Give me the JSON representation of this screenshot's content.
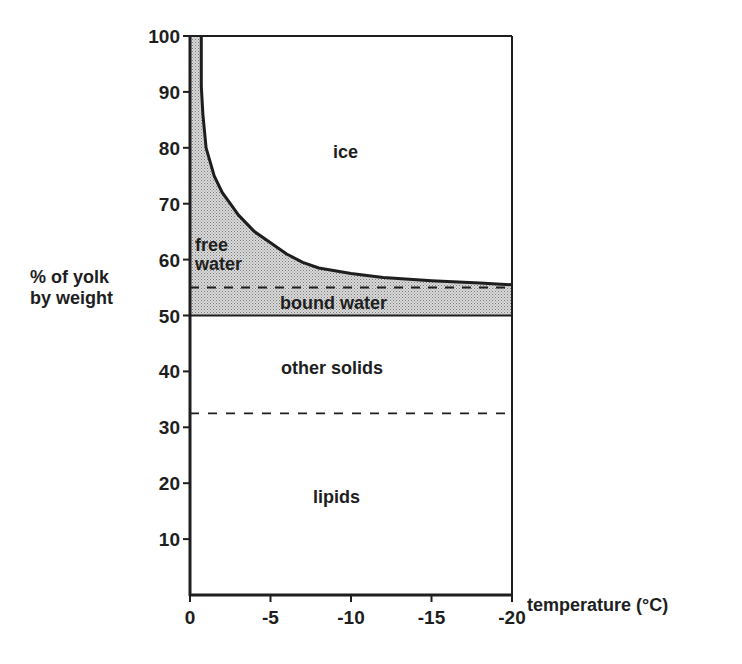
{
  "chart_data": {
    "type": "area",
    "title": "",
    "xlabel": "temperature (°C)",
    "ylabel": "% of yolk by weight",
    "ylabel_lines": [
      "% of yolk",
      "by weight"
    ],
    "xlim": [
      0,
      -20
    ],
    "ylim": [
      0,
      100
    ],
    "x_ticks": [
      0,
      -5,
      -10,
      -15,
      -20
    ],
    "x_tick_labels": [
      "0",
      "-5",
      "-10",
      "-15",
      "-20"
    ],
    "y_ticks": [
      10,
      20,
      30,
      40,
      50,
      60,
      70,
      80,
      90,
      100
    ],
    "y_tick_labels": [
      "10",
      "20",
      "30",
      "40",
      "50",
      "60",
      "70",
      "80",
      "90",
      "100"
    ],
    "grid": false,
    "legend": "none (regions labeled inline)",
    "series": [
      {
        "name": "free water / ice boundary (total unfrozen water + solids)",
        "style": "solid thick line",
        "x": [
          -0.7,
          -0.7,
          -0.8,
          -1.0,
          -1.5,
          -2.0,
          -2.5,
          -3.0,
          -4.0,
          -5.0,
          -6.0,
          -7.0,
          -8.0,
          -10.0,
          -12.0,
          -15.0,
          -18.0,
          -20.0
        ],
        "y": [
          100,
          91,
          86,
          80,
          75,
          72,
          70,
          68,
          65,
          63,
          61,
          59.5,
          58.5,
          57.5,
          56.8,
          56.2,
          55.8,
          55.5
        ]
      },
      {
        "name": "free water / bound water boundary",
        "style": "dashed line",
        "x": [
          0,
          -20
        ],
        "y": [
          55,
          55
        ]
      },
      {
        "name": "bound water / other solids boundary",
        "style": "solid line",
        "x": [
          0,
          -20
        ],
        "y": [
          50,
          50
        ]
      },
      {
        "name": "other solids / lipids boundary",
        "style": "dashed line",
        "x": [
          0,
          -20
        ],
        "y": [
          32.5,
          32.5
        ]
      }
    ],
    "regions": [
      {
        "label": "ice",
        "from": "curve",
        "to": 100,
        "fill": "white"
      },
      {
        "label": "free water",
        "from": 55,
        "to": "curve",
        "fill": "stippled grey"
      },
      {
        "label": "bound water",
        "from": 50,
        "to": 55,
        "fill": "stippled grey"
      },
      {
        "label": "other solids",
        "from": 32.5,
        "to": 50,
        "fill": "white"
      },
      {
        "label": "lipids",
        "from": 0,
        "to": 32.5,
        "fill": "white"
      }
    ]
  },
  "labels": {
    "ice": "ice",
    "free_1": "free",
    "free_2": "water",
    "bound_water": "bound water",
    "other_solids": "other solids",
    "lipids": "lipids",
    "ylabel_1": "% of yolk",
    "ylabel_2": "by weight",
    "xlabel": "temperature (°C)"
  },
  "colors": {
    "ink": "#1e1e1e",
    "stipple_fill": "#c4c4c4",
    "background": "#ffffff"
  }
}
